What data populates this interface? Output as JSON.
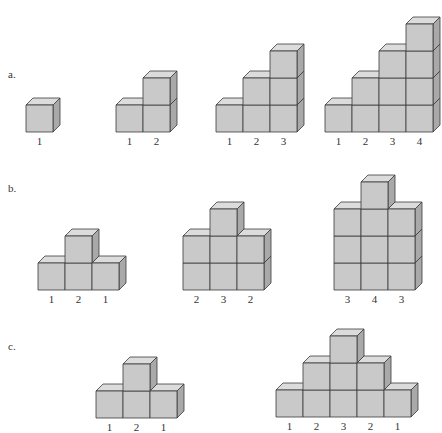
{
  "colors": {
    "front": "#c9c9c9",
    "top": "#dcdcdc",
    "side": "#a9a9a9",
    "edge": "#3a3a3a",
    "text": "#333333"
  },
  "cube": {
    "size": 27,
    "dx": 7,
    "dy": -7
  },
  "rows": [
    {
      "label": "a.",
      "label_pos": [
        8,
        68
      ],
      "figures": [
        {
          "x": 26,
          "base": 132,
          "heights": [
            1
          ],
          "labels": [
            "1"
          ]
        },
        {
          "x": 116,
          "base": 132,
          "heights": [
            1,
            2
          ],
          "labels": [
            "1",
            "2"
          ]
        },
        {
          "x": 216,
          "base": 132,
          "heights": [
            1,
            2,
            3
          ],
          "labels": [
            "1",
            "2",
            "3"
          ]
        },
        {
          "x": 325,
          "base": 132,
          "heights": [
            1,
            2,
            3,
            4
          ],
          "labels": [
            "1",
            "2",
            "3",
            "4"
          ]
        }
      ]
    },
    {
      "label": "b.",
      "label_pos": [
        8,
        182
      ],
      "figures": [
        {
          "x": 38,
          "base": 290,
          "heights": [
            1,
            2,
            1
          ],
          "labels": [
            "1",
            "2",
            "1"
          ]
        },
        {
          "x": 183,
          "base": 290,
          "heights": [
            2,
            3,
            2
          ],
          "labels": [
            "2",
            "3",
            "2"
          ]
        },
        {
          "x": 334,
          "base": 290,
          "heights": [
            3,
            4,
            3
          ],
          "labels": [
            "3",
            "4",
            "3"
          ]
        }
      ]
    },
    {
      "label": "c.",
      "label_pos": [
        8,
        340
      ],
      "figures": [
        {
          "x": 96,
          "base": 418,
          "heights": [
            1,
            2,
            1
          ],
          "labels": [
            "1",
            "2",
            "1"
          ]
        },
        {
          "x": 276,
          "base": 417,
          "heights": [
            1,
            2,
            3,
            2,
            1
          ],
          "labels": [
            "1",
            "2",
            "3",
            "2",
            "1"
          ]
        }
      ]
    }
  ]
}
